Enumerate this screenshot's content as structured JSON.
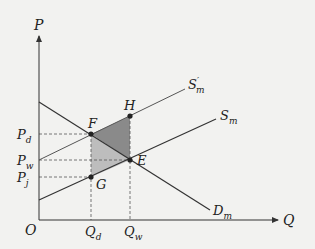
{
  "diagram": {
    "axes": {
      "y_label": "P",
      "x_label": "Q",
      "origin_label": "O"
    },
    "curves": {
      "supply_shifted": {
        "label": "S",
        "sub": "m",
        "prime": "′"
      },
      "supply": {
        "label": "S",
        "sub": "m"
      },
      "demand": {
        "label": "D",
        "sub": "m"
      }
    },
    "points": {
      "F": "F",
      "H": "H",
      "E": "E",
      "G": "G"
    },
    "price_labels": {
      "pd": {
        "main": "P",
        "sub": "d"
      },
      "pw": {
        "main": "P",
        "sub": "w"
      },
      "pj": {
        "main": "P",
        "sub": "j"
      }
    },
    "quantity_labels": {
      "qd": {
        "main": "Q",
        "sub": "d"
      },
      "qw": {
        "main": "Q",
        "sub": "w"
      }
    },
    "colors": {
      "dark_shade": "#8a8a8a",
      "light_shade": "#bdbdbd",
      "line": "#333333"
    }
  }
}
